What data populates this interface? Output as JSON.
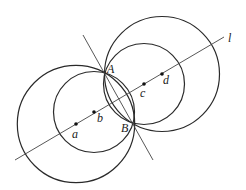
{
  "diagram": {
    "stroke_color": "#2a2a2a",
    "line_l": {
      "x1": 15,
      "y1": 160,
      "x2": 224,
      "y2": 37,
      "label": "l",
      "label_x": 228,
      "label_y": 42
    },
    "perpendicular": {
      "x1": 83,
      "y1": 35,
      "x2": 153,
      "y2": 160
    },
    "points": [
      {
        "name": "a",
        "x": 76,
        "y": 124,
        "label_x": 72,
        "label_y": 138
      },
      {
        "name": "b",
        "x": 94,
        "y": 112,
        "label_x": 97,
        "label_y": 122
      },
      {
        "name": "c",
        "x": 144,
        "y": 84,
        "label_x": 140,
        "label_y": 97
      },
      {
        "name": "d",
        "x": 162,
        "y": 74,
        "label_x": 163,
        "label_y": 84
      }
    ],
    "intersections": [
      {
        "name": "A",
        "x": 105,
        "y": 73,
        "label_x": 107,
        "label_y": 73
      },
      {
        "name": "B",
        "x": 134,
        "y": 124,
        "label_x": 121,
        "label_y": 132
      }
    ],
    "circles": [
      {
        "center": "a",
        "cx": 76,
        "cy": 124,
        "r": 58.7
      },
      {
        "center": "b",
        "cx": 94,
        "cy": 112,
        "r": 40.5
      },
      {
        "center": "c",
        "cx": 144,
        "cy": 84,
        "r": 40.5
      },
      {
        "center": "d",
        "cx": 162,
        "cy": 74,
        "r": 57.5
      }
    ]
  }
}
